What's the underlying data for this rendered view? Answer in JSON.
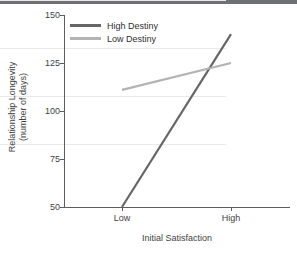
{
  "chart_data": {
    "type": "line",
    "title": "",
    "subtitle": "",
    "xlabel": "Initial Satisfaction",
    "ylabel": "Relationship Longevity\n(number of days)",
    "ylabel_line1": "Relationship Longevity",
    "ylabel_line2": "(number of days)",
    "categories": [
      "Low",
      "High"
    ],
    "x_tick_labels": [
      "Low",
      "High"
    ],
    "y_tick_labels": [
      "150",
      "125",
      "100",
      "75",
      "50"
    ],
    "y_ticks": [
      150,
      125,
      100,
      75,
      50
    ],
    "ylim": [
      50,
      150
    ],
    "grid": true,
    "grid_axis": "y",
    "legend_position": "top-left",
    "series": [
      {
        "name": "High Destiny",
        "values": [
          50,
          140
        ],
        "color": "#666666"
      },
      {
        "name": "Low Destiny",
        "values": [
          111,
          125
        ],
        "color": "#b3b3b3"
      }
    ]
  },
  "axes": {
    "y_title_line1": "Relationship Longevity",
    "y_title_line2": "(number of days)",
    "x_title": "Initial Satisfaction",
    "y_ticks": [
      {
        "label": "150",
        "value": 150
      },
      {
        "label": "125",
        "value": 125
      },
      {
        "label": "100",
        "value": 100
      },
      {
        "label": "75",
        "value": 75
      },
      {
        "label": "50",
        "value": 50
      }
    ],
    "x_ticks": [
      {
        "label": "Low",
        "value": 0
      },
      {
        "label": "High",
        "value": 1
      }
    ]
  },
  "legend": {
    "items": [
      {
        "label": "High Destiny",
        "color": "#666666"
      },
      {
        "label": "Low Destiny",
        "color": "#b3b3b3"
      }
    ]
  },
  "colors": {
    "high_destiny": "#666666",
    "low_destiny": "#b3b3b3",
    "axis": "#5d5d5d",
    "grid": "#e9e9e9",
    "text": "#3f3f3f",
    "topbar": "#6e7074",
    "background": "#ffffff"
  }
}
